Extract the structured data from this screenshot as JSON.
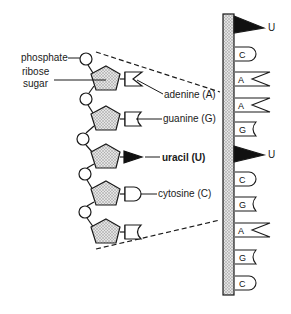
{
  "diagram": {
    "labels": {
      "phosphate": "phosphate",
      "ribose_line1": "ribose",
      "ribose_line2": "sugar",
      "adenine": "adenine (A)",
      "guanine": "guanine (G)",
      "uracil": "uracil (U)",
      "cytosine": "cytosine (C)"
    },
    "left_chain": {
      "nucleotides": [
        {
          "base": "A",
          "shape": "notch"
        },
        {
          "base": "G",
          "shape": "crescent"
        },
        {
          "base": "U",
          "shape": "triangle"
        },
        {
          "base": "C",
          "shape": "round"
        },
        {
          "base": "G",
          "shape": "crescent"
        }
      ]
    },
    "strand": {
      "bases": [
        {
          "letter": "U",
          "shape": "triangle",
          "outside_label": "U"
        },
        {
          "letter": "C",
          "shape": "round"
        },
        {
          "letter": "A",
          "shape": "notch"
        },
        {
          "letter": "A",
          "shape": "notch"
        },
        {
          "letter": "G",
          "shape": "crescent"
        },
        {
          "letter": "U",
          "shape": "triangle",
          "outside_label": "U"
        },
        {
          "letter": "C",
          "shape": "round"
        },
        {
          "letter": "G",
          "shape": "crescent"
        },
        {
          "letter": "A",
          "shape": "notch"
        },
        {
          "letter": "G",
          "shape": "crescent"
        },
        {
          "letter": "C",
          "shape": "round"
        }
      ]
    },
    "colors": {
      "line": "#1a1a1a",
      "sugar_fill": "#cfcfcf",
      "backbone_fill": "#d6d6d6"
    }
  }
}
